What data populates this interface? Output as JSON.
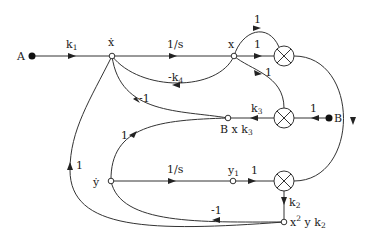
{
  "diagram": {
    "type": "signal-flow-graph",
    "nodes": {
      "A": {
        "label": "A"
      },
      "xdot": {
        "label": "ẋ"
      },
      "x": {
        "label": "x"
      },
      "B": {
        "label": "B"
      },
      "Bxk3": {
        "label_main": "B x k",
        "label_sub": "3"
      },
      "ydot": {
        "label": "ẏ"
      },
      "y1": {
        "label_main": "y",
        "label_sub": "1"
      },
      "x2yk2": {
        "label_x": "x",
        "label_sup": "2",
        "label_rest": " y k",
        "label_sub": "2"
      }
    },
    "multipliers": [
      "top-multiplier",
      "middle-multiplier",
      "bottom-multiplier"
    ],
    "edges": {
      "A_to_xdot": {
        "main": "k",
        "sub": "1"
      },
      "xdot_to_x": {
        "label": "1/s"
      },
      "x_to_topmult_straight": {
        "label": "1"
      },
      "x_to_topmult_arc": {
        "label": "1"
      },
      "x_to_midmult": {
        "label": "1"
      },
      "x_to_xdot_feedback": {
        "main": "-k",
        "sub": "4"
      },
      "Bxk3_to_xdot": {
        "label": "-1"
      },
      "midmult_to_Bxk3": {
        "main": "k",
        "sub": "3"
      },
      "B_to_midmult": {
        "label": "1"
      },
      "Bxk3_to_ydot": {
        "label": "1"
      },
      "ydot_to_y1": {
        "label": "1/s"
      },
      "y1_to_botmult": {
        "label": "1"
      },
      "botmult_to_x2yk2": {
        "main": "k",
        "sub": "2"
      },
      "x2yk2_to_ydot": {
        "label": "-1"
      },
      "x2yk2_to_xdot": {
        "label": "1"
      }
    }
  }
}
